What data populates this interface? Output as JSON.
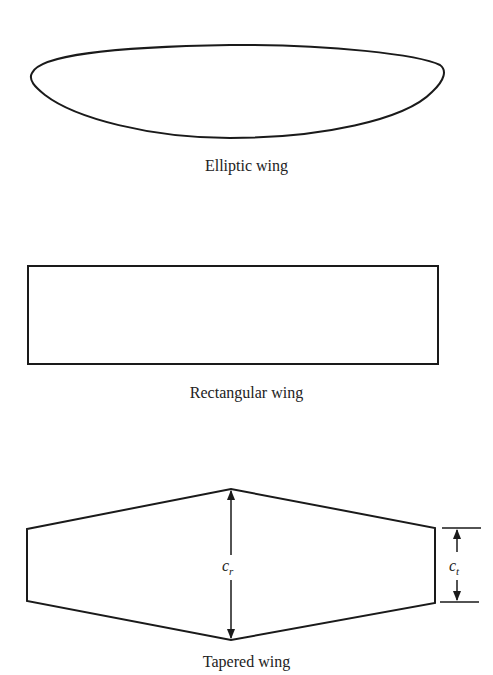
{
  "figure": {
    "panels": [
      {
        "id": "elliptic",
        "caption": "Elliptic wing"
      },
      {
        "id": "rectangular",
        "caption": "Rectangular wing"
      },
      {
        "id": "tapered",
        "caption": "Tapered wing",
        "labels": {
          "root_chord": {
            "base": "c",
            "sub": "r"
          },
          "tip_chord": {
            "base": "c",
            "sub": "t"
          }
        }
      }
    ],
    "colors": {
      "stroke": "#1a1a1a",
      "background": "#ffffff"
    }
  }
}
